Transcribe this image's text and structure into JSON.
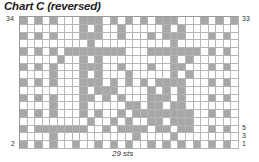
{
  "title": "Chart C (reversed)",
  "stitch_count_label": "29 sts",
  "row_labels": {
    "left_top": "34",
    "left_bottom": "2",
    "right_top": "33",
    "right_5": "5",
    "right_3": "3",
    "right_1": "1"
  },
  "colors": {
    "shaded": "#a7a7a7",
    "empty": "#ffffff",
    "gridline": "#b5b5b5"
  },
  "grid": {
    "columns": 29,
    "rows": 17,
    "pattern": [
      "X.X.X...XXX.X.X.X.XXX...X.X.X",
      "........X.X..X.....X.X.......",
      "X.X.X...XXX..X...X.XXX...X.X.",
      ".........X..........X........",
      "X.X.X.XXXXXXXX...XXXXXXX.X.X.",
      ".....X..X.X.........X.X......",
      "X.X.X...XXX..X...X..XX...X.X.",
      "....X...X.X...X.....X.X......",
      "X.X.X...XXX.X.X.X.XXXX...X.X.",
      "........X.XXX....X.X.X.......",
      "X.X.X...XX.X.X...XXX.X...X.X.",
      "....X...X.....XX.XX.XX.......",
      "X.X.X...X.X..X.XXXXXXXX..X.X.",
      ".........X..X.X..XX.XXX......",
      "X.XXXXXXX..X.XXXX.XX.XX..X.X.",
      "....X..........X....X........",
      "X.X.X..X..X.X.X..X.X.X.X.X.X."
    ]
  }
}
